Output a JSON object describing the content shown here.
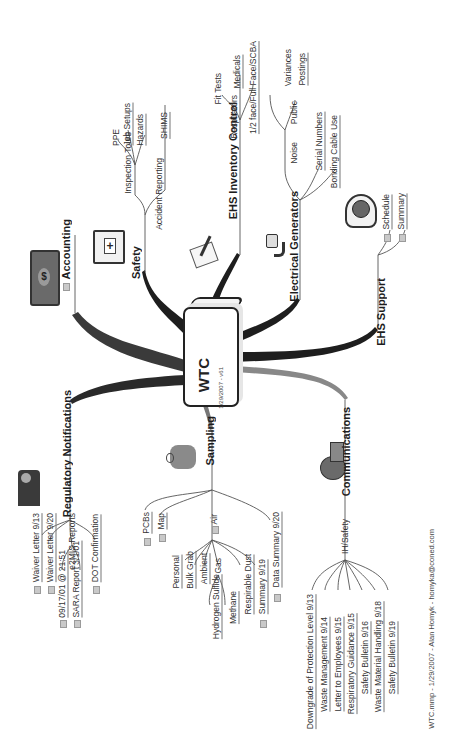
{
  "center": {
    "title": "WTC",
    "subtitle": "1/29/2007 - v61"
  },
  "branches": {
    "accounting": {
      "label": "Accounting",
      "icon": "money-icon"
    },
    "safety": {
      "label": "Safety",
      "icon": "first-aid-kit-icon",
      "children": {
        "inspection_tours": {
          "label": "Inspection Tours",
          "children": [
            "PPE",
            "Job Setups",
            "Hazards"
          ]
        },
        "accident_reporting": {
          "label": "Accident Reporting",
          "children": [
            "SHIMS"
          ]
        }
      }
    },
    "ehs_inventory": {
      "label": "EHS Inventory Control",
      "icon": "checklist-icon",
      "children": {
        "respirators": {
          "label": "Respirators",
          "children": [
            "Fit Tests",
            "Medicals",
            "1/2 face/Full Face/SCBA"
          ]
        }
      }
    },
    "electrical": {
      "label": "Electrical Generators",
      "icon": "power-plug-icon",
      "children": {
        "noise": {
          "label": "Noise",
          "children": {
            "public": {
              "label": "Public",
              "children": [
                "Variances",
                "Postings"
              ]
            }
          }
        },
        "serial": "Serial Numbers",
        "bonding": "Bonding Cable Use"
      }
    },
    "ehs_support": {
      "label": "EHS Support",
      "icon": "clock-icon",
      "children": [
        "Schedule",
        "Summary"
      ]
    },
    "regulatory": {
      "label": "Regulatory Notifications",
      "icon": "judge-icon",
      "children": {
        "waiver1": "Waiver Letter 9/13",
        "waiver2": "Waiver Letter 9/20",
        "e2mis": {
          "label": "e2MIS Reports",
          "children": [
            "09/17/01 @ 21:51",
            "SARA Report 3/1/01"
          ]
        },
        "dot": "DOT Confirmation"
      }
    },
    "sampling": {
      "label": "Sampling",
      "icon": "sampler-worker-icon",
      "children": {
        "pcbs": "PCBs",
        "map": "Map",
        "air": {
          "label": "Air",
          "children": {
            "personal": "Personal",
            "bulk_grab": "Bulk Grab",
            "ambient": "Ambient",
            "gas": {
              "label": "Gas",
              "children": [
                "Hydrogen Sulfide",
                "Methane"
              ]
            },
            "respirable_dust": "Respirable Dust",
            "summary": "Summary 9/19"
          }
        },
        "data_summary": "Data Summary 9/20"
      }
    },
    "communications": {
      "label": "Communications",
      "icon": "megaphone-icon",
      "children": {
        "ih_safety": {
          "label": "IH/Safety",
          "children": [
            "Downgrade of Protection Level 9/13",
            "Waste Management 9/14",
            "Letter to Employees 9/15",
            "Respiratory Guidance 9/15",
            "Safety Bulletin 9/16",
            "Waste Material Handling 9/18",
            "Safety Bulletin 9/19"
          ]
        }
      }
    }
  },
  "footer": "WTC.mmp - 1/29/2007 - Alan Homyk - homyka@coned.com",
  "colors": {
    "line": "#555555",
    "trunk": "#1e1e1e",
    "text": "#333333",
    "background": "#ffffff"
  }
}
